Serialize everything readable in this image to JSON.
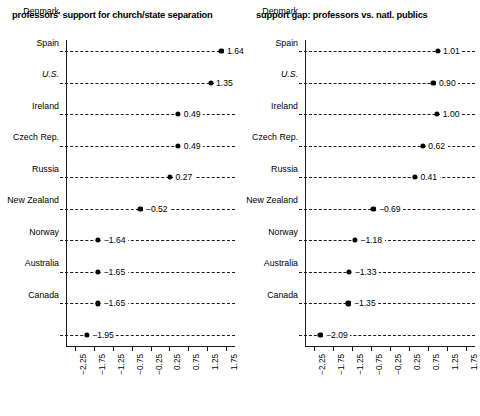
{
  "chart_data": [
    {
      "type": "scatter",
      "panel": "left",
      "title": "professors' support for church/state separation",
      "xlabel": "",
      "ylabel": "",
      "xlim": [
        -2.5,
        2.0
      ],
      "grid": "dashed-horizontal-rules",
      "legend": "none",
      "categories": [
        "Denmark",
        "Spain",
        "U.S.",
        "Ireland",
        "Czech Rep.",
        "Russia",
        "New Zealand",
        "Norway",
        "Australia",
        "Canada"
      ],
      "values": [
        1.64,
        1.35,
        0.49,
        0.49,
        0.27,
        -0.52,
        -1.64,
        -1.65,
        -1.65,
        -1.95
      ],
      "value_labels": [
        "1.64",
        "1.35",
        "0.49",
        "0.49",
        "0.27",
        "−0.52",
        "−1.64",
        "−1.65",
        "−1.65",
        "−1.95"
      ],
      "xticks": [
        -2.25,
        -1.75,
        -1.25,
        -0.75,
        -0.25,
        0.25,
        0.75,
        1.25,
        1.75
      ],
      "xtick_labels": [
        "−2.25",
        "−1.75",
        "−1.25",
        "−0.75",
        "−0.25",
        "0.25",
        "0.75",
        "1.25",
        "1.75"
      ]
    },
    {
      "type": "scatter",
      "panel": "right",
      "title": "support gap: professors vs. natl. publics",
      "xlabel": "",
      "ylabel": "",
      "xlim": [
        -2.5,
        2.0
      ],
      "grid": "dashed-horizontal-rules",
      "legend": "none",
      "categories": [
        "Denmark",
        "Spain",
        "U.S.",
        "Ireland",
        "Czech Rep.",
        "Russia",
        "New Zealand",
        "Norway",
        "Australia",
        "Canada"
      ],
      "values": [
        1.01,
        0.9,
        1.0,
        0.62,
        0.41,
        -0.69,
        -1.18,
        -1.33,
        -1.35,
        -2.09
      ],
      "value_labels": [
        "1.01",
        "0.90",
        "1.00",
        "0.62",
        "0.41",
        "−0.69",
        "−1.18",
        "−1.33",
        "−1.35",
        "−2.09"
      ],
      "xticks": [
        -2.25,
        -1.75,
        -1.25,
        -0.75,
        -0.25,
        0.25,
        0.75,
        1.25,
        1.75
      ],
      "xtick_labels": [
        "−2.25",
        "−1.75",
        "−1.25",
        "−0.75",
        "−0.25",
        "0.25",
        "0.75",
        "1.25",
        "1.75"
      ]
    }
  ],
  "colors": {
    "axis": "#1a1a1a",
    "marker": "#000000",
    "background": "#ffffff",
    "text": "#000000"
  }
}
